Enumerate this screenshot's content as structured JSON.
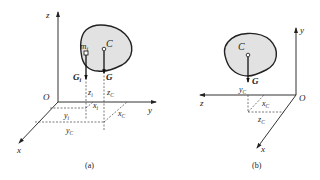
{
  "figure": {
    "panels": [
      {
        "id": "a",
        "caption": "(a)",
        "axes": {
          "z": "z",
          "y": "y",
          "x": "x",
          "origin": "O"
        },
        "body_labels": {
          "centroid": "C",
          "mass_element": "m",
          "mass_element_sub": "i"
        },
        "forces": {
          "total": "G",
          "element": "G",
          "element_sub": "i"
        },
        "coordinate_labels": {
          "z_i": "z",
          "z_i_sub": "i",
          "z_C": "z",
          "z_C_sub": "C",
          "x_i": "x",
          "x_i_sub": "i",
          "x_C": "x",
          "x_C_sub": "C",
          "y_i": "y",
          "y_i_sub": "i",
          "y_C": "y",
          "y_C_sub": "C"
        }
      },
      {
        "id": "b",
        "caption": "(b)",
        "axes": {
          "z": "z",
          "y": "y",
          "x": "x",
          "origin": "O"
        },
        "body_labels": {
          "centroid": "C"
        },
        "forces": {
          "total": "G"
        },
        "coordinate_labels": {
          "y_C": "y",
          "y_C_sub": "C",
          "x_C": "x",
          "x_C_sub": "C",
          "z_C": "z",
          "z_C_sub": "C"
        }
      }
    ],
    "colors": {
      "body_fill": "#e2e2e2",
      "line": "#222222",
      "background": "#ffffff"
    }
  }
}
